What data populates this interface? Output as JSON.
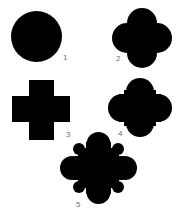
{
  "figure": {
    "background": "#ffffff",
    "shape_color": "#000000",
    "label_color": "#6f6f6f",
    "shapes": [
      {
        "id": 1,
        "label": "1",
        "kind": "circle",
        "description": "solid circle"
      },
      {
        "id": 2,
        "label": "2",
        "kind": "quatrefoil",
        "description": "four overlapping circles (quatrefoil)"
      },
      {
        "id": 3,
        "label": "3",
        "kind": "cross",
        "description": "plus-shaped cross"
      },
      {
        "id": 4,
        "label": "4",
        "kind": "quatrefoil-cross",
        "description": "quatrefoil combined with cross steps"
      },
      {
        "id": 5,
        "label": "5",
        "kind": "compound-quatrefoil",
        "description": "elaborate diamond of lobes and small circles"
      }
    ]
  }
}
